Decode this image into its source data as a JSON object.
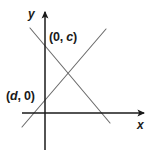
{
  "figure": {
    "kind": "coordinate-plane-line-graph",
    "background_color": "#ffffff",
    "width": 157,
    "height": 151,
    "axis_color": "#1a1a1a",
    "line_color": "#6b6b6b",
    "label_color": "#1a1a1a"
  },
  "axes": {
    "x_axis_label": "x",
    "y_axis_label": "y",
    "origin": {
      "x": 45,
      "y": 113
    },
    "x_axis": {
      "start_x": 22,
      "end_x": 148,
      "y": 113,
      "has_arrow": true
    },
    "y_axis": {
      "x": 45,
      "start_y": 150,
      "end_y": 8,
      "has_arrow": true
    }
  },
  "labels": {
    "y_intercept": {
      "open_paren": "(",
      "x_value": "0",
      "comma": ", ",
      "y_value": "c",
      "close_paren": ")",
      "full_text": "(0, c)"
    },
    "x_intercept": {
      "open_paren": "(",
      "x_value": "d",
      "comma": ", ",
      "y_value": "0",
      "close_paren": ")",
      "full_text": "(d, 0)"
    }
  },
  "lines": [
    {
      "name": "descending-line",
      "description": "line with negative slope passing through (0, c)",
      "x1": 30,
      "y1": 28,
      "x2": 110,
      "y2": 123
    },
    {
      "name": "ascending-line",
      "description": "line with positive slope passing through (d, 0)",
      "x1": 22,
      "y1": 127,
      "x2": 106,
      "y2": 29
    }
  ],
  "intersection": {
    "x": 66,
    "y": 77
  }
}
